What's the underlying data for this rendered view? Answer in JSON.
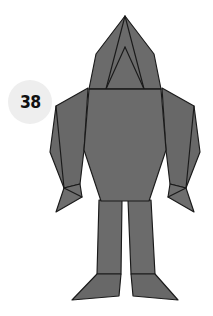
{
  "page": {
    "background_color": "#ffffff",
    "width": 213,
    "height": 316
  },
  "badge": {
    "number": "38",
    "fill_color": "#eeeeee",
    "text_color": "#111111"
  },
  "figure": {
    "name": "origami-humanoid-figure",
    "fill_color": "#6b6b6b",
    "fold_line_color": "#1a1a1a",
    "outline_color": "#1a1a1a",
    "parts": [
      {
        "name": "head-hood",
        "label": "Head"
      },
      {
        "name": "torso",
        "label": "Torso"
      },
      {
        "name": "left-arm",
        "label": "Left arm"
      },
      {
        "name": "right-arm",
        "label": "Right arm"
      },
      {
        "name": "left-hand",
        "label": "Left hand"
      },
      {
        "name": "right-hand",
        "label": "Right hand"
      },
      {
        "name": "left-leg",
        "label": "Left leg"
      },
      {
        "name": "right-leg",
        "label": "Right leg"
      },
      {
        "name": "left-foot",
        "label": "Left foot"
      },
      {
        "name": "right-foot",
        "label": "Right foot"
      }
    ]
  },
  "shapes": {
    "head_outline": "125,16 97,52 88,88 162,88 154,52",
    "head_fold_left": "125,16 107,88",
    "head_fold_right": "125,16 143,88",
    "head_fold_center_left": "107,88 125,48",
    "head_fold_center_right": "143,88 125,48",
    "torso": "88,88 162,88 166,150 150,200 100,200 84,150",
    "left_arm_outer": "88,88 56,104 50,150 63,186 78,182 84,150",
    "right_arm_outer": "162,88 194,104 200,150 187,186 172,182 166,150",
    "left_hand": "63,186 78,182 80,196 58,210",
    "right_hand": "187,186 172,182 170,196 192,210",
    "left_leg": "100,200 122,200 120,272 96,272",
    "right_leg": "128,200 150,200 154,272 130,272",
    "left_foot": "96,272 120,272 118,294 74,298",
    "right_foot": "130,272 154,272 176,298 132,294"
  }
}
